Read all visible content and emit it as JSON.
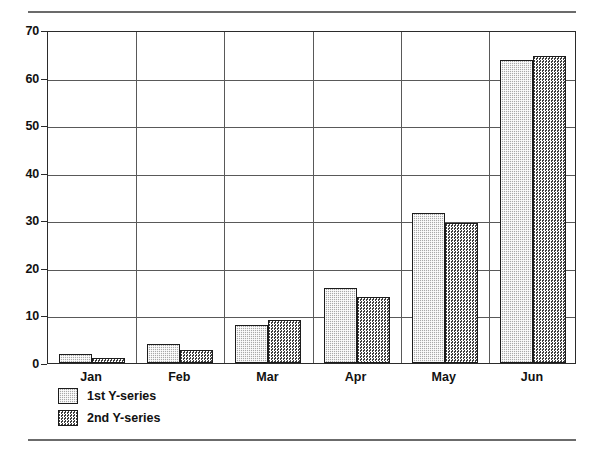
{
  "chart_data": {
    "type": "bar",
    "title": "",
    "subtitle": "",
    "xlabel": "",
    "ylabel": "",
    "categories": [
      "Jan",
      "Feb",
      "Mar",
      "Apr",
      "May",
      "Jun"
    ],
    "series": [
      {
        "name": "1st Y-series",
        "values": [
          2,
          4,
          8,
          15.8,
          31.5,
          63.8
        ],
        "color": "#a9a9a9",
        "pattern": "fine-dot"
      },
      {
        "name": "2nd Y-series",
        "values": [
          1,
          2.8,
          9,
          13.8,
          29.5,
          64.5
        ],
        "color": "#5e5e5e",
        "pattern": "checkerboard"
      }
    ],
    "ylim": [
      0,
      70
    ],
    "ytick_values": [
      0,
      10,
      20,
      30,
      40,
      50,
      60,
      70
    ],
    "ytick_labels": [
      "0",
      "10",
      "20",
      "30",
      "40",
      "50",
      "60",
      "70"
    ],
    "grid": {
      "horizontal": true,
      "vertical": true
    },
    "legend": {
      "position": "below-left",
      "entries": [
        "1st Y-series",
        "2nd Y-series"
      ]
    },
    "annotations": []
  },
  "figure": {
    "rules": {
      "top": "horizontal-rule",
      "bottom": "horizontal-rule"
    }
  }
}
